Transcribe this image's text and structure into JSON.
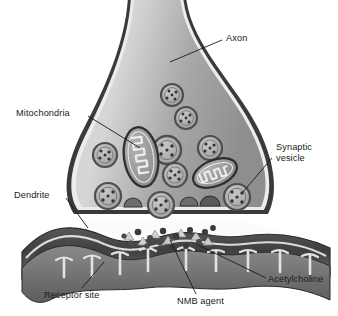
{
  "figure": {
    "background_color": "#ffffff",
    "width": 338,
    "height": 316
  },
  "palette": {
    "outline": "#2b2b2b",
    "terminal_fill_light": "#d9d9d9",
    "terminal_fill_mid": "#a8a8a8",
    "terminal_fill_dark": "#8d8d8d",
    "membrane_rim": "#efefef",
    "vesicle_ring": "#5a5a5a",
    "vesicle_fill": "#b4b4b4",
    "mitochondria_fill": "#9a9a9a",
    "dendrite_dark": "#4a4a4a",
    "dendrite_mid": "#6e6e6e",
    "dendrite_light": "#d2d2d2",
    "cleft_white": "#fbfbfb",
    "acetylcholine_dot": "#3a3a3a",
    "nmb_triangle": "#cfcfcf",
    "leader_line": "#1a1a1a",
    "label_text": "#1a1a1a"
  },
  "labels": [
    {
      "id": "axon",
      "text": "Axon",
      "x": 226,
      "y": 33,
      "lines": [
        "Axon"
      ]
    },
    {
      "id": "mitochondria",
      "text": "Mitochondria",
      "x": 16,
      "y": 108,
      "lines": [
        "Mitochondria"
      ]
    },
    {
      "id": "synaptic-vesicle",
      "text": "Synaptic vesicle",
      "x": 276,
      "y": 142,
      "lines": [
        "Synaptic",
        "vesicle"
      ]
    },
    {
      "id": "dendrite",
      "text": "Dendrite",
      "x": 14,
      "y": 190,
      "lines": [
        "Dendrite"
      ]
    },
    {
      "id": "acetylcholine",
      "text": "Acetylcholine",
      "x": 268,
      "y": 274,
      "lines": [
        "Acetylcholine"
      ]
    },
    {
      "id": "receptor-site",
      "text": "Receptor site",
      "x": 44,
      "y": 290,
      "lines": [
        "Receptor site"
      ]
    },
    {
      "id": "nmb-agent",
      "text": "NMB agent",
      "x": 177,
      "y": 296,
      "lines": [
        "NMB agent"
      ]
    }
  ],
  "leader_lines": [
    {
      "id": "leader-axon",
      "from": [
        222,
        40
      ],
      "to": [
        170,
        62
      ]
    },
    {
      "id": "leader-mitochondria",
      "from": [
        88,
        116
      ],
      "to": [
        140,
        148
      ]
    },
    {
      "id": "leader-synaptic",
      "from": [
        272,
        158
      ],
      "to": [
        243,
        192
      ]
    },
    {
      "id": "leader-dendrite",
      "from": [
        66,
        198
      ],
      "to": [
        88,
        228
      ]
    },
    {
      "id": "leader-acetylcholine",
      "from": [
        266,
        278
      ],
      "to": [
        196,
        244
      ]
    },
    {
      "id": "leader-receptor",
      "from": [
        82,
        288
      ],
      "to": [
        104,
        262
      ]
    },
    {
      "id": "leader-nmb",
      "from": [
        196,
        294
      ],
      "to": [
        170,
        240
      ]
    }
  ],
  "structures": {
    "axon_terminal": {
      "name": "axon terminal bouton",
      "description": "bulb-shaped presynaptic terminal with narrow axon neck at top"
    },
    "vesicles": [
      {
        "cx": 172,
        "cy": 95,
        "r": 11
      },
      {
        "cx": 186,
        "cy": 118,
        "r": 11
      },
      {
        "cx": 105,
        "cy": 155,
        "r": 12
      },
      {
        "cx": 167,
        "cy": 150,
        "r": 14
      },
      {
        "cx": 210,
        "cy": 148,
        "r": 12
      },
      {
        "cx": 175,
        "cy": 175,
        "r": 12
      },
      {
        "cx": 108,
        "cy": 196,
        "r": 13
      },
      {
        "cx": 161,
        "cy": 205,
        "r": 13
      },
      {
        "cx": 237,
        "cy": 197,
        "r": 13
      }
    ],
    "mitochondria": [
      {
        "id": "mitochondrion-left",
        "cx": 141,
        "cy": 157,
        "rx": 17,
        "ry": 30,
        "rotate": -8
      },
      {
        "id": "mitochondrion-right",
        "cx": 215,
        "cy": 173,
        "rx": 22,
        "ry": 14,
        "rotate": -22
      }
    ],
    "release_sites": [
      {
        "cx": 132,
        "cy": 214
      },
      {
        "cx": 188,
        "cy": 212
      },
      {
        "cx": 208,
        "cy": 212
      }
    ],
    "dendrite": {
      "name": "postsynaptic dendrite with junctional folds",
      "fold_count": 8
    },
    "cleft_particles": {
      "acetylcholine": [
        [
          138,
          232
        ],
        [
          150,
          238
        ],
        [
          163,
          231
        ],
        [
          147,
          246
        ],
        [
          176,
          236
        ],
        [
          190,
          230
        ],
        [
          199,
          242
        ],
        [
          131,
          243
        ],
        [
          172,
          247
        ],
        [
          205,
          232
        ],
        [
          160,
          243
        ],
        [
          186,
          246
        ]
      ],
      "nmb_agent": [
        [
          129,
          236
        ],
        [
          155,
          234
        ],
        [
          168,
          240
        ],
        [
          181,
          233
        ],
        [
          196,
          236
        ],
        [
          143,
          240
        ],
        [
          208,
          240
        ]
      ]
    }
  }
}
